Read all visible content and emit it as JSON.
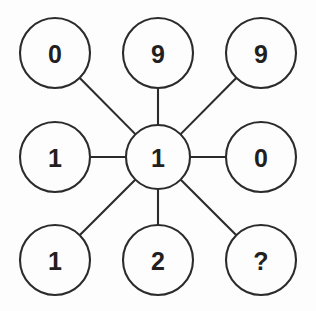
{
  "diagram": {
    "type": "number-wheel-puzzle",
    "background_color": "#fdfdfd",
    "line_color": "#2b2b2b",
    "text_color": "#231f20",
    "stroke_width": 2.1,
    "hub": {
      "id": "hub",
      "label": "1",
      "cx": 158,
      "cy": 157,
      "r": 32
    },
    "outer_radius": 35,
    "nodes": [
      {
        "id": "top-left",
        "label": "0",
        "cx": 55,
        "cy": 53,
        "r": 35
      },
      {
        "id": "top-middle",
        "label": "9",
        "cx": 158,
        "cy": 53,
        "r": 35
      },
      {
        "id": "top-right",
        "label": "9",
        "cx": 261,
        "cy": 53,
        "r": 35
      },
      {
        "id": "middle-left",
        "label": "1",
        "cx": 55,
        "cy": 157,
        "r": 35
      },
      {
        "id": "middle-right",
        "label": "0",
        "cx": 261,
        "cy": 157,
        "r": 35
      },
      {
        "id": "bottom-left",
        "label": "1",
        "cx": 55,
        "cy": 260,
        "r": 35
      },
      {
        "id": "bottom-middle",
        "label": "2",
        "cx": 158,
        "cy": 260,
        "r": 35
      },
      {
        "id": "bottom-right",
        "label": "?",
        "cx": 261,
        "cy": 260,
        "r": 35
      }
    ],
    "edges": [
      {
        "id": "edge-hub-top-left",
        "from": "hub",
        "to": "top-left"
      },
      {
        "id": "edge-hub-top-middle",
        "from": "hub",
        "to": "top-middle"
      },
      {
        "id": "edge-hub-top-right",
        "from": "hub",
        "to": "top-right"
      },
      {
        "id": "edge-hub-middle-left",
        "from": "hub",
        "to": "middle-left"
      },
      {
        "id": "edge-hub-middle-right",
        "from": "hub",
        "to": "middle-right"
      },
      {
        "id": "edge-hub-bottom-left",
        "from": "hub",
        "to": "bottom-left"
      },
      {
        "id": "edge-hub-bottom-middle",
        "from": "hub",
        "to": "bottom-middle"
      },
      {
        "id": "edge-hub-bottom-right",
        "from": "hub",
        "to": "bottom-right"
      }
    ]
  }
}
